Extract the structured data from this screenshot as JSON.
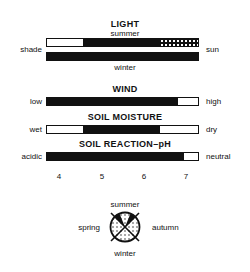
{
  "light": {
    "title": "LIGHT",
    "summer_label": "summer",
    "winter_label": "winter",
    "left_label": "shade",
    "right_label": "sun",
    "summer_segments": [
      {
        "type": "empty",
        "from": 0.0,
        "to": 0.24
      },
      {
        "type": "solid",
        "from": 0.24,
        "to": 0.75
      },
      {
        "type": "dotted",
        "from": 0.75,
        "to": 1.0
      }
    ],
    "winter_segments": [
      {
        "type": "solid",
        "from": 0.0,
        "to": 1.0
      }
    ]
  },
  "wind": {
    "title": "WIND",
    "left_label": "low",
    "right_label": "high",
    "segments": [
      {
        "type": "solid",
        "from": 0.0,
        "to": 0.87
      },
      {
        "type": "empty",
        "from": 0.87,
        "to": 1.0
      }
    ]
  },
  "soil_moisture": {
    "title": "SOIL MOISTURE",
    "left_label": "wet",
    "right_label": "dry",
    "segments": [
      {
        "type": "empty",
        "from": 0.0,
        "to": 0.24
      },
      {
        "type": "solid",
        "from": 0.24,
        "to": 0.75
      },
      {
        "type": "empty",
        "from": 0.75,
        "to": 1.0
      }
    ]
  },
  "soil_reaction": {
    "title": "SOIL REACTION–pH",
    "left_label": "acidic",
    "right_label": "neutral",
    "segments": [
      {
        "type": "solid",
        "from": 0.0,
        "to": 0.91
      },
      {
        "type": "empty",
        "from": 0.91,
        "to": 1.0
      }
    ],
    "ticks": [
      "4",
      "5",
      "6",
      "7"
    ]
  },
  "seasons": {
    "top": "summer",
    "left": "spring",
    "right": "autumn",
    "bottom": "winter",
    "legend": {
      "solid": "flowering",
      "dotted": "foliage"
    }
  }
}
